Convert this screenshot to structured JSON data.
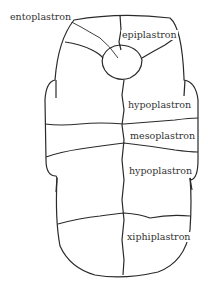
{
  "diagram": {
    "labels": {
      "entoplastron": "entoplastron",
      "epiplastron": "epiplastron",
      "hypoplastron_upper": "hypoplastron",
      "mesoplastron": "mesoplastron",
      "hypoplastron_lower": "hypoplastron",
      "xiphiplastron": "xiphiplastron"
    },
    "colors": {
      "line": "#2a2a2a",
      "text": "#333333",
      "background": "#ffffff"
    }
  }
}
